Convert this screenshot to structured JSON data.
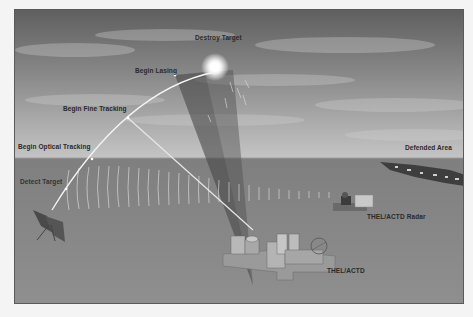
{
  "diagram": {
    "labels": {
      "destroy_target": "Destroy Target",
      "begin_lasing": "Begin Lasing",
      "begin_fine_tracking": "Begin Fine Tracking",
      "begin_optical_tracking": "Begin Optical Tracking",
      "detect_target": "Detect Target",
      "defended_area": "Defended Area",
      "radar": "THEL/ACTD Radar",
      "thel_actd": "THEL/ACTD"
    },
    "colors": {
      "sky_top": "#6e6e6e",
      "sky_horizon": "#b8b8b8",
      "ground": "#8c8c8c",
      "trajectory": "#f2f2f2",
      "beam_cone": "#5a5a5a"
    }
  }
}
